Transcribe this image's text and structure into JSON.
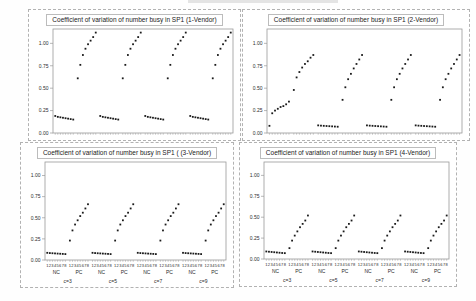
{
  "colors": {
    "panel_border": "#b2b2b2",
    "plot_box_border": "#9a9a9a",
    "point": "#1a1a1a",
    "text": "#2b2b2b"
  },
  "axis": {
    "y_ticks": [
      "1.00",
      "0.75",
      "0.50",
      "0.25",
      "0.00"
    ],
    "y_tick_values": [
      1.0,
      0.75,
      0.5,
      0.25,
      0.0
    ],
    "ymax": 1.16
  },
  "x_axis": {
    "slot_digits": [
      "1",
      "2",
      "3",
      "4",
      "5",
      "6",
      "7",
      "8"
    ],
    "subgroup_labels": [
      "NC",
      "PC"
    ],
    "group_labels": [
      "c=3",
      "c=5",
      "c=7",
      "c=9"
    ]
  },
  "chart_data": [
    {
      "type": "scatter",
      "title": "Coefficient of variation of number busy in SP1 (1-Vendor)",
      "ylabel": "Coefficient of variation",
      "ylim": [
        0,
        1.16
      ],
      "show_x_labels": false,
      "groups": [
        {
          "label": "c=3",
          "NC": [
            0.19,
            0.18,
            0.175,
            0.17,
            0.165,
            0.16,
            0.155,
            0.15
          ],
          "PC": [
            0.61,
            0.76,
            0.87,
            0.94,
            0.99,
            1.03,
            1.07,
            1.12
          ]
        },
        {
          "label": "c=5",
          "NC": [
            0.19,
            0.18,
            0.175,
            0.17,
            0.165,
            0.16,
            0.155,
            0.15
          ],
          "PC": [
            0.61,
            0.76,
            0.87,
            0.94,
            0.99,
            1.03,
            1.07,
            1.12
          ]
        },
        {
          "label": "c=7",
          "NC": [
            0.19,
            0.18,
            0.175,
            0.17,
            0.165,
            0.16,
            0.155,
            0.15
          ],
          "PC": [
            0.61,
            0.76,
            0.87,
            0.94,
            0.99,
            1.03,
            1.07,
            1.12
          ]
        },
        {
          "label": "c=9",
          "NC": [
            0.19,
            0.18,
            0.175,
            0.17,
            0.165,
            0.16,
            0.155,
            0.15
          ],
          "PC": [
            0.61,
            0.76,
            0.87,
            0.94,
            0.99,
            1.03,
            1.07,
            1.12
          ]
        }
      ]
    },
    {
      "type": "scatter",
      "title": "Coefficient of variation of number busy in SP1 (2-Vendor)",
      "ylabel": "Coefficient of variation",
      "ylim": [
        0,
        1.16
      ],
      "show_x_labels": false,
      "groups": [
        {
          "label": "c=3",
          "NC": [
            0.08,
            0.22,
            0.25,
            0.27,
            0.29,
            0.3,
            0.32,
            0.35
          ],
          "PC": [
            0.48,
            0.62,
            0.68,
            0.73,
            0.77,
            0.8,
            0.84,
            0.87
          ]
        },
        {
          "label": "c=5",
          "NC": [
            0.085,
            0.082,
            0.08,
            0.078,
            0.076,
            0.074,
            0.072,
            0.07
          ],
          "PC": [
            0.37,
            0.51,
            0.6,
            0.66,
            0.72,
            0.77,
            0.82,
            0.87
          ]
        },
        {
          "label": "c=7",
          "NC": [
            0.085,
            0.082,
            0.08,
            0.078,
            0.076,
            0.074,
            0.072,
            0.07
          ],
          "PC": [
            0.37,
            0.51,
            0.6,
            0.66,
            0.72,
            0.77,
            0.82,
            0.87
          ]
        },
        {
          "label": "c=9",
          "NC": [
            0.085,
            0.082,
            0.08,
            0.078,
            0.076,
            0.074,
            0.072,
            0.07
          ],
          "PC": [
            0.37,
            0.51,
            0.6,
            0.66,
            0.72,
            0.77,
            0.82,
            0.87
          ]
        }
      ]
    },
    {
      "type": "scatter",
      "title": "Coefficient of variation of number busy in SP1 ( (3-Vendor)",
      "ylabel": "Coefficient of variation",
      "ylim": [
        0,
        1.16
      ],
      "show_x_labels": true,
      "groups": [
        {
          "label": "c=3",
          "NC": [
            0.085,
            0.082,
            0.08,
            0.078,
            0.076,
            0.074,
            0.072,
            0.07
          ],
          "PC": [
            0.23,
            0.35,
            0.42,
            0.47,
            0.52,
            0.56,
            0.61,
            0.66
          ]
        },
        {
          "label": "c=5",
          "NC": [
            0.085,
            0.082,
            0.08,
            0.078,
            0.076,
            0.074,
            0.072,
            0.07
          ],
          "PC": [
            0.23,
            0.35,
            0.42,
            0.47,
            0.52,
            0.56,
            0.61,
            0.66
          ]
        },
        {
          "label": "c=7",
          "NC": [
            0.085,
            0.082,
            0.08,
            0.078,
            0.076,
            0.074,
            0.072,
            0.07
          ],
          "PC": [
            0.23,
            0.35,
            0.42,
            0.47,
            0.52,
            0.56,
            0.61,
            0.66
          ]
        },
        {
          "label": "c=9",
          "NC": [
            0.085,
            0.082,
            0.08,
            0.078,
            0.076,
            0.074,
            0.072,
            0.07
          ],
          "PC": [
            0.23,
            0.35,
            0.42,
            0.47,
            0.52,
            0.56,
            0.61,
            0.66
          ]
        }
      ]
    },
    {
      "type": "scatter",
      "title": "Coefficient of variation of number busy in SP1 (4-Vendor)",
      "ylabel": "Coefficient of variation",
      "ylim": [
        0,
        1.16
      ],
      "show_x_labels": true,
      "groups": [
        {
          "label": "c=3",
          "NC": [
            0.09,
            0.087,
            0.084,
            0.081,
            0.078,
            0.075,
            0.072,
            0.07
          ],
          "PC": [
            0.13,
            0.22,
            0.28,
            0.33,
            0.38,
            0.42,
            0.46,
            0.52
          ]
        },
        {
          "label": "c=5",
          "NC": [
            0.09,
            0.087,
            0.084,
            0.081,
            0.078,
            0.075,
            0.072,
            0.07
          ],
          "PC": [
            0.13,
            0.22,
            0.28,
            0.33,
            0.38,
            0.42,
            0.46,
            0.52
          ]
        },
        {
          "label": "c=7",
          "NC": [
            0.09,
            0.087,
            0.084,
            0.081,
            0.078,
            0.075,
            0.072,
            0.07
          ],
          "PC": [
            0.13,
            0.22,
            0.28,
            0.33,
            0.38,
            0.42,
            0.46,
            0.52
          ]
        },
        {
          "label": "c=9",
          "NC": [
            0.09,
            0.087,
            0.084,
            0.081,
            0.078,
            0.075,
            0.072,
            0.07
          ],
          "PC": [
            0.13,
            0.22,
            0.28,
            0.33,
            0.38,
            0.42,
            0.46,
            0.52
          ]
        }
      ]
    }
  ]
}
